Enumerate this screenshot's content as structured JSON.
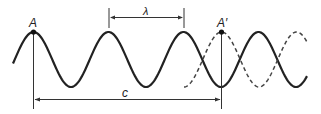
{
  "diagram": {
    "labels": {
      "point_a": "A",
      "point_a_prime": "A′",
      "wavelength": "λ",
      "distance": "c"
    },
    "colors": {
      "stroke": "#222222",
      "dashed": "#444444",
      "background": "#ffffff"
    }
  }
}
